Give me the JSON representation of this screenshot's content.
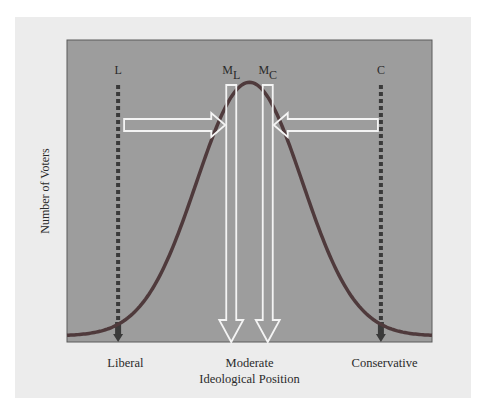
{
  "chart_data": {
    "type": "diagram",
    "title": "",
    "xlabel": "Ideological Position",
    "ylabel": "Number of Voters",
    "x_range": [
      0,
      100
    ],
    "y_range": [
      0,
      100
    ],
    "x_tick_labels": [
      {
        "label": "Liberal",
        "x": 16
      },
      {
        "label": "Moderate",
        "x": 50
      },
      {
        "label": "Conservative",
        "x": 87
      }
    ],
    "distribution": {
      "name": "voter distribution",
      "shape": "normal",
      "mean": 50,
      "sd": 14.5,
      "peak": 86,
      "floor": 2
    },
    "positions": [
      {
        "id": "L",
        "label": "L",
        "sub": "",
        "x": 14,
        "style": "dotted"
      },
      {
        "id": "ML",
        "label": "M",
        "sub": "L",
        "x": 45,
        "style": "hollow-arrow-down"
      },
      {
        "id": "MC",
        "label": "M",
        "sub": "C",
        "x": 55,
        "style": "hollow-arrow-down"
      },
      {
        "id": "C",
        "label": "C",
        "sub": "",
        "x": 86,
        "style": "dotted"
      }
    ],
    "movement_arrows": [
      {
        "from": "L",
        "to": "ML",
        "direction": "right"
      },
      {
        "from": "C",
        "to": "MC",
        "direction": "left"
      }
    ],
    "colors": {
      "paper": "#ececec",
      "plot_bg": "#9d9d9d",
      "curve": "#4f3a3c",
      "dotted": "#3a3a3a",
      "arrow_outline": "#f4f4f4"
    }
  }
}
